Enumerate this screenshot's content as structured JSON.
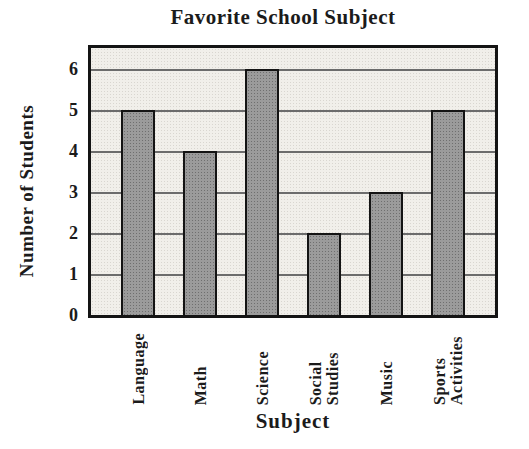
{
  "chart_data": {
    "type": "bar",
    "title": "Favorite School Subject",
    "xlabel": "Subject",
    "ylabel": "Number of Students",
    "categories": [
      "Language",
      "Math",
      "Science",
      "Social\nStudies",
      "Music",
      "Sports\nActivities"
    ],
    "values": [
      5,
      4,
      6,
      2,
      3,
      5
    ],
    "yticks": [
      0,
      1,
      2,
      3,
      4,
      5,
      6
    ],
    "ylim": [
      0,
      6.5
    ],
    "grid": true,
    "legend": false,
    "colors": {
      "page_bg": "#ffffff",
      "text": "#1b1b1b",
      "frame": "#141414",
      "plot_bg": "#f1efea",
      "plot_bg_dot": "#d9d6d0",
      "grid_line": "#6c6c6c",
      "bar_fill": "#9b9b9b",
      "bar_dot": "#6f6f6f",
      "bar_border": "#141414"
    }
  }
}
